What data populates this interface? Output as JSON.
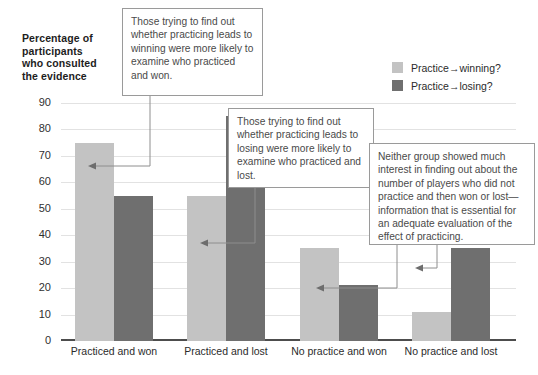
{
  "chart_data": {
    "type": "bar",
    "title": "",
    "ylabel": "Percentage of participants who consulted the evidence",
    "xlabel": "",
    "categories": [
      "Practiced and won",
      "Practiced and lost",
      "No practice and won",
      "No practice and lost"
    ],
    "series": [
      {
        "name": "Practice→winning?",
        "color": "#c3c3c3",
        "values": [
          75,
          55,
          35,
          11
        ]
      },
      {
        "name": "Practice→losing?",
        "color": "#6f6f6f",
        "values": [
          55,
          85,
          21,
          35
        ]
      }
    ],
    "ylim": [
      0,
      90
    ],
    "yticks": [
      0,
      10,
      20,
      30,
      40,
      50,
      60,
      70,
      80,
      90
    ],
    "ytick_labels": [
      "0",
      "10",
      "20",
      "30",
      "40",
      "50",
      "60",
      "70",
      "80",
      "90"
    ],
    "grid": true,
    "legend_position": "top-right",
    "annotations": [
      "Those trying to find out whether practicing leads to winning were more likely to examine who practiced and won.",
      "Those trying to find out whether practicing leads to losing were more likely to examine who practiced and lost.",
      "Neither group showed much interest in finding out about the number of players who did not practice and then won or lost—information that is essential for an adequate evaluation of the effect of practicing."
    ]
  },
  "axis_title": {
    "line1": "Percentage of",
    "line2": "participants",
    "line3": "who consulted",
    "line4": "the evidence"
  },
  "legend": {
    "items": [
      {
        "label": "Practice→winning?",
        "color": "#c3c3c3"
      },
      {
        "label": "Practice→losing?",
        "color": "#6f6f6f"
      }
    ]
  },
  "callouts": [
    {
      "id": "callout-1",
      "text": "Those trying to find out whether practicing leads to winning were more likely to examine who practiced and won."
    },
    {
      "id": "callout-2",
      "text": "Those trying to find out whether practicing leads to losing were more likely to examine who practiced and lost."
    },
    {
      "id": "callout-3",
      "text": "Neither group showed much interest in finding out about the number of players who did not practice and then won or lost—information that is essential for an adequate evaluation of the effect of practicing."
    }
  ],
  "colors": {
    "light_bar": "#c3c3c3",
    "dark_bar": "#6f6f6f",
    "gridline": "#e2e2e2",
    "axis": "#4d4d4d",
    "callout_border": "#9a9a9a",
    "text": "#3a3a3a"
  }
}
